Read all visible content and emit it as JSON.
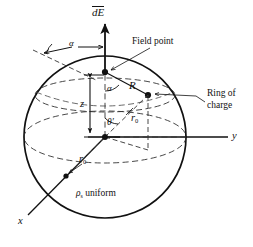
{
  "figure": {
    "background_color": "#ffffff",
    "stroke_color": "#111111",
    "width": 253,
    "height": 247
  },
  "labels": {
    "dE_vector": "dE",
    "field_point": "Field point",
    "ring_of_charge_line1": "Ring of",
    "ring_of_charge_line2": "charge",
    "alpha_top": "α",
    "alpha_field": "α",
    "R": "R",
    "z": "z",
    "theta_prime_symbol": "θ",
    "theta_prime_mark": "′",
    "r0_upper_symbol": "r",
    "r0_upper_sub": "0",
    "r0_lower_symbol": "r",
    "r0_lower_sub": "0",
    "rho_symbol": "ρ",
    "rho_sub": "s",
    "rho_text": "uniform",
    "axis_y": "y",
    "axis_x": "x"
  },
  "geometry": {
    "sphere_center_x": 105,
    "sphere_center_y": 137,
    "sphere_radius": 81,
    "field_point_x": 105,
    "field_point_y": 72,
    "ring_point_x": 148,
    "ring_point_y": 95,
    "ring_foot_x": 148,
    "ring_foot_y": 137,
    "x_axis_point_x": 66,
    "x_axis_point_y": 175,
    "y_axis_end_x": 228,
    "y_axis_end_y": 137,
    "dE_arrow_top_y": 22
  }
}
